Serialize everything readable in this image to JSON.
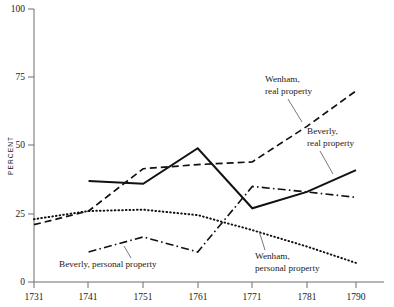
{
  "chart_data": {
    "type": "line",
    "title": "",
    "xlabel": "",
    "ylabel": "PERCENT",
    "x": [
      1731,
      1741,
      1751,
      1761,
      1771,
      1781,
      1790
    ],
    "xtick_labels": [
      "1731",
      "1741",
      "1751",
      "1761",
      "1771",
      "1781",
      "1790"
    ],
    "ytick_labels": [
      "0",
      "25",
      "50",
      "75",
      "100"
    ],
    "yticks": [
      0,
      25,
      50,
      75,
      100
    ],
    "ylim": [
      0,
      100
    ],
    "xlim": [
      1731,
      1790
    ],
    "grid": false,
    "legend": "inline-annotations",
    "series": [
      {
        "name": "Beverly, real property",
        "style": "solid",
        "x": [
          1741,
          1751,
          1761,
          1771,
          1781,
          1790
        ],
        "values": [
          37,
          36,
          49,
          27,
          33,
          41
        ]
      },
      {
        "name": "Wenham, real property",
        "style": "dashed",
        "x": [
          1731,
          1741,
          1751,
          1761,
          1771,
          1781,
          1790
        ],
        "values": [
          21,
          26,
          41.5,
          43,
          44,
          57,
          70
        ]
      },
      {
        "name": "Wenham, personal property",
        "style": "dotted",
        "x": [
          1731,
          1741,
          1751,
          1761,
          1771,
          1781,
          1790
        ],
        "values": [
          23,
          26,
          26.5,
          24.5,
          19,
          13,
          7
        ]
      },
      {
        "name": "Beverly, personal property",
        "style": "dash-dot",
        "x": [
          1741,
          1751,
          1761,
          1771,
          1781,
          1790
        ],
        "values": [
          11,
          16.5,
          11,
          35,
          33,
          31
        ]
      }
    ],
    "annotations": [
      {
        "id": "wenham-real",
        "line1": "Wenham,",
        "line2": "real property"
      },
      {
        "id": "beverly-real",
        "line1": "Beverly,",
        "line2": "real property"
      },
      {
        "id": "beverly-personal",
        "line1": "Beverly, personal property",
        "line2": ""
      },
      {
        "id": "wenham-personal",
        "line1": "Wenham,",
        "line2": "personal property"
      }
    ],
    "colors": {
      "line": "#111111",
      "axis": "#6d6d6d",
      "text": "#1a1a1a",
      "background": "#ffffff"
    }
  }
}
